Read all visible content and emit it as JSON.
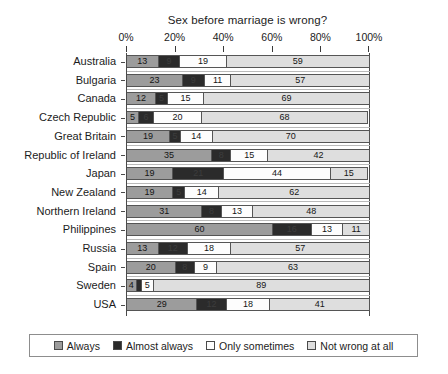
{
  "chart_data": {
    "type": "bar",
    "subtype": "stacked-horizontal-100-percent",
    "title": "Sex before marriage is wrong?",
    "xlabel": "",
    "ylabel": "",
    "xlim": [
      0,
      100
    ],
    "xticks": [
      0,
      20,
      40,
      60,
      80,
      100
    ],
    "xtick_labels": [
      "0%",
      "20%",
      "40%",
      "60%",
      "80%",
      "100%"
    ],
    "grid": false,
    "legend_position": "bottom",
    "categories": [
      "Australia",
      "Bulgaria",
      "Canada",
      "Czech Republic",
      "Great Britain",
      "Republic of Ireland",
      "Japan",
      "New Zealand",
      "Northern Ireland",
      "Philippines",
      "Russia",
      "Spain",
      "Sweden",
      "USA"
    ],
    "series": [
      {
        "name": "Always",
        "color": "#9c9c9c",
        "values": [
          13,
          23,
          12,
          5,
          19,
          35,
          19,
          19,
          31,
          60,
          13,
          20,
          4,
          29
        ]
      },
      {
        "name": "Almost always",
        "color": "#2b2b2b",
        "values": [
          9,
          9,
          5,
          6,
          5,
          8,
          21,
          5,
          8,
          16,
          12,
          8,
          2,
          12
        ]
      },
      {
        "name": "Only sometimes",
        "color": "#fdfdfd",
        "values": [
          19,
          11,
          15,
          20,
          14,
          15,
          44,
          14,
          13,
          13,
          18,
          9,
          5,
          18
        ]
      },
      {
        "name": "Not wrong at all",
        "color": "#dedede",
        "values": [
          59,
          57,
          69,
          68,
          70,
          42,
          15,
          62,
          48,
          11,
          57,
          63,
          89,
          41
        ]
      }
    ],
    "value_labels": [
      [
        "13",
        "9",
        "19",
        "59"
      ],
      [
        "23",
        "9",
        "11",
        "57"
      ],
      [
        "12",
        "5",
        "15",
        "69"
      ],
      [
        "5",
        "6",
        "20",
        "68"
      ],
      [
        "19",
        "5",
        "14",
        "70"
      ],
      [
        "35",
        "8",
        "15",
        "42"
      ],
      [
        "19",
        "21",
        "44",
        "15"
      ],
      [
        "19",
        "5",
        "14",
        "62"
      ],
      [
        "31",
        "8",
        "13",
        "48"
      ],
      [
        "60",
        "16",
        "13",
        "11"
      ],
      [
        "13",
        "12",
        "18",
        "57"
      ],
      [
        "20",
        "8",
        "9",
        "63"
      ],
      [
        "4",
        "",
        "5",
        "89"
      ],
      [
        "29",
        "12",
        "18",
        "41"
      ]
    ]
  },
  "legend": {
    "items": [
      {
        "label": "Always",
        "color": "#9c9c9c"
      },
      {
        "label": "Almost always",
        "color": "#2b2b2b"
      },
      {
        "label": "Only sometimes",
        "color": "#fdfdfd"
      },
      {
        "label": "Not wrong at all",
        "color": "#dedede"
      }
    ]
  }
}
